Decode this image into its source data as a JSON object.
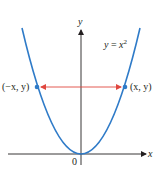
{
  "figure": {
    "equation_label": "y = x²",
    "equation_parts": {
      "lhs": "y",
      "eq": " = ",
      "base": "x",
      "exp": "2"
    },
    "axis_labels": {
      "x": "x",
      "y": "y",
      "origin": "0"
    },
    "point_left": "(−x, y)",
    "point_right": "(x, y)",
    "colors": {
      "curve": "#2f7bc8",
      "arrow": "#e0473f",
      "axis": "#231f20",
      "point": "#2f7bc8"
    }
  }
}
